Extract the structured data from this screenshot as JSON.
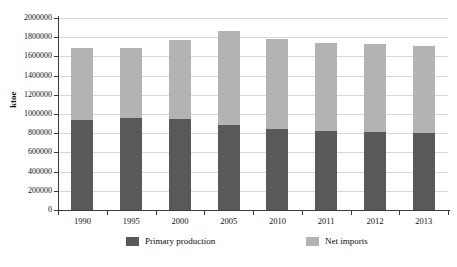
{
  "chart_data": {
    "type": "bar",
    "stacked": true,
    "title": "",
    "xlabel": "",
    "ylabel": "ktoe",
    "ylim": [
      0,
      2000000
    ],
    "ytick_step": 200000,
    "ytick_labels": [
      "2000000",
      "1800000",
      "1600000",
      "1400000",
      "1200000",
      "1000000",
      "800000",
      "600000",
      "400000",
      "200000",
      "0"
    ],
    "yticks": [
      2000000,
      1800000,
      1600000,
      1400000,
      1200000,
      1000000,
      800000,
      600000,
      400000,
      200000,
      0
    ],
    "grid": true,
    "legend_position": "bottom",
    "categories": [
      "1990",
      "1995",
      "2000",
      "2005",
      "2010",
      "2011",
      "2012",
      "2013"
    ],
    "series": [
      {
        "name": "Primary production",
        "color": "#595959",
        "values": [
          940000,
          960000,
          945000,
          885000,
          840000,
          825000,
          815000,
          800000
        ]
      },
      {
        "name": "Net imports",
        "color": "#b3b3b3",
        "values": [
          750000,
          730000,
          825000,
          980000,
          940000,
          920000,
          910000,
          910000
        ]
      }
    ],
    "totals": [
      1690000,
      1690000,
      1770000,
      1865000,
      1780000,
      1745000,
      1725000,
      1710000
    ]
  },
  "axis": {
    "y_title": "ktoe"
  }
}
